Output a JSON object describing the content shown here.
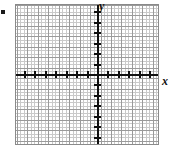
{
  "figure": {
    "name": "coordinate-plane",
    "bullet_marker": "▪",
    "axis_labels": {
      "x": "x",
      "y": "y"
    }
  },
  "chart_data": {
    "type": "scatter",
    "title": "",
    "xlabel": "x",
    "ylabel": "y",
    "grid": true,
    "legend": null,
    "series": [],
    "x": [],
    "values": [],
    "xlim": [
      -8,
      6
    ],
    "ylim": [
      -7,
      7
    ],
    "x_major_tick_interval": 1,
    "y_major_tick_interval": 1,
    "minor_grid_per_major": 3,
    "x_tick_positions": [
      -8,
      -7,
      -6,
      -5,
      -4,
      -3,
      -2,
      -1,
      0,
      1,
      2,
      3,
      4,
      5,
      6
    ],
    "y_tick_positions": [
      -7,
      -6,
      -5,
      -4,
      -3,
      -2,
      -1,
      0,
      1,
      2,
      3,
      4,
      5,
      6,
      7
    ],
    "x_tick_labels": [
      "",
      "",
      "",
      "",
      "",
      "",
      "",
      "",
      "",
      "",
      "",
      "",
      "",
      "",
      ""
    ],
    "y_tick_labels": [
      "",
      "",
      "",
      "",
      "",
      "",
      "",
      "",
      "",
      "",
      "",
      "",
      "",
      "",
      ""
    ],
    "annotations": []
  }
}
